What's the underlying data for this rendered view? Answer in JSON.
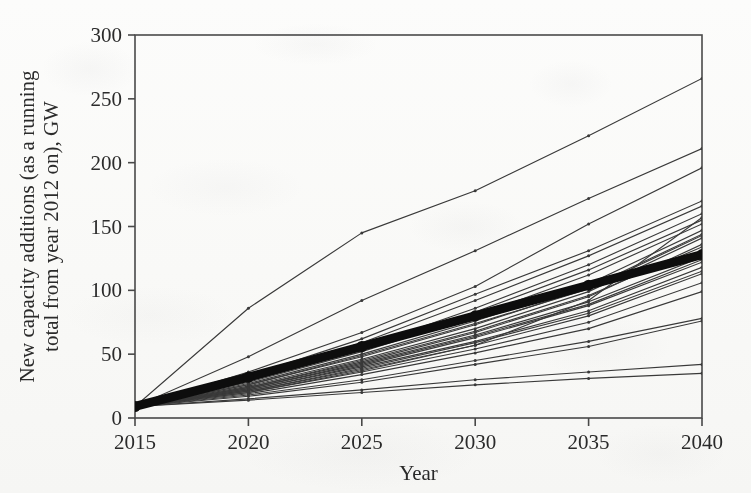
{
  "chart_data": {
    "type": "line",
    "title": "",
    "subtitle": "",
    "xlabel": "Year",
    "ylabel": "New capacity additions (as a running total from year 2012 on), GW",
    "ylabel_line1": "New capacity additions (as a running",
    "ylabel_line2": "total from year 2012 on), GW",
    "x": [
      2015,
      2020,
      2025,
      2030,
      2035,
      2040
    ],
    "xtick_labels": [
      "2015",
      "2020",
      "2025",
      "2030",
      "2035",
      "2040"
    ],
    "ytick_labels": [
      "0",
      "50",
      "100",
      "150",
      "200",
      "250",
      "300"
    ],
    "yticks": [
      0,
      50,
      100,
      150,
      200,
      250,
      300
    ],
    "xlim": [
      2015,
      2040
    ],
    "ylim": [
      0,
      300
    ],
    "grid": false,
    "legend": "none",
    "markers": "small dots at each 5-year data point",
    "colors": {
      "lines": "#3a3a3a",
      "highlight": "#0d0d0d",
      "axis": "#4a4a4a",
      "text": "#2b2b2b"
    },
    "annotations": [
      "All scenario trajectories converge to a common 2015 value of about 9 GW.",
      "One thick bold black line denotes the central/reference trajectory, ending near 128 GW in 2040."
    ],
    "series": [
      {
        "name": "scenario-01",
        "style": "thin",
        "values": [
          9,
          86,
          145,
          178,
          221,
          266
        ]
      },
      {
        "name": "scenario-02",
        "style": "thin",
        "values": [
          9,
          48,
          92,
          131,
          172,
          211
        ]
      },
      {
        "name": "scenario-03",
        "style": "thin",
        "values": [
          9,
          36,
          67,
          103,
          152,
          196
        ]
      },
      {
        "name": "scenario-04",
        "style": "thin",
        "values": [
          9,
          33,
          62,
          97,
          131,
          170
        ]
      },
      {
        "name": "scenario-05",
        "style": "thin",
        "values": [
          9,
          31,
          59,
          92,
          127,
          166
        ]
      },
      {
        "name": "scenario-06",
        "style": "thin",
        "values": [
          9,
          30,
          55,
          86,
          120,
          160
        ]
      },
      {
        "name": "scenario-07",
        "style": "thin",
        "values": [
          9,
          28,
          52,
          80,
          112,
          152
        ]
      },
      {
        "name": "scenario-08",
        "style": "thin",
        "values": [
          9,
          27,
          50,
          76,
          105,
          147
        ]
      },
      {
        "name": "scenario-09",
        "style": "thin",
        "values": [
          9,
          26,
          48,
          73,
          102,
          144
        ]
      },
      {
        "name": "scenario-10",
        "style": "thin",
        "values": [
          9,
          25,
          46,
          70,
          99,
          141
        ]
      },
      {
        "name": "scenario-11",
        "style": "thin",
        "values": [
          9,
          24,
          44,
          67,
          95,
          136
        ]
      },
      {
        "name": "reference-central",
        "style": "bold",
        "values": [
          9,
          32,
          56,
          80,
          104,
          128
        ]
      },
      {
        "name": "scenario-12",
        "style": "thin",
        "values": [
          9,
          23,
          43,
          65,
          91,
          126
        ]
      },
      {
        "name": "scenario-13",
        "style": "thin",
        "values": [
          9,
          22,
          41,
          63,
          88,
          122
        ]
      },
      {
        "name": "scenario-14",
        "style": "thin",
        "values": [
          9,
          22,
          40,
          60,
          84,
          118
        ]
      },
      {
        "name": "scenario-15",
        "style": "thin",
        "values": [
          9,
          21,
          38,
          57,
          80,
          113
        ]
      },
      {
        "name": "scenario-16",
        "style": "thin",
        "values": [
          9,
          20,
          36,
          54,
          75,
          106
        ]
      },
      {
        "name": "scenario-17",
        "style": "thin",
        "values": [
          9,
          19,
          34,
          51,
          70,
          99
        ]
      },
      {
        "name": "scenario-18",
        "style": "thin",
        "values": [
          9,
          24,
          45,
          68,
          96,
          134
        ]
      },
      {
        "name": "scenario-19",
        "style": "thin",
        "values": [
          9,
          20,
          37,
          57,
          92,
          157
        ]
      },
      {
        "name": "scenario-20",
        "style": "thin",
        "values": [
          9,
          18,
          30,
          45,
          60,
          78
        ]
      },
      {
        "name": "scenario-21",
        "style": "thin",
        "values": [
          9,
          17,
          28,
          42,
          56,
          76
        ]
      },
      {
        "name": "scenario-22",
        "style": "thin",
        "values": [
          9,
          15,
          22,
          30,
          36,
          42
        ]
      },
      {
        "name": "scenario-23",
        "style": "thin",
        "values": [
          9,
          14,
          20,
          26,
          31,
          35
        ]
      },
      {
        "name": "scenario-24",
        "style": "thin",
        "values": [
          9,
          26,
          49,
          74,
          101,
          143
        ]
      },
      {
        "name": "scenario-25",
        "style": "thin",
        "values": [
          9,
          29,
          53,
          83,
          116,
          155
        ]
      },
      {
        "name": "scenario-26",
        "style": "thin",
        "values": [
          9,
          21,
          39,
          59,
          82,
          115
        ]
      },
      {
        "name": "scenario-27",
        "style": "thin",
        "values": [
          9,
          23,
          42,
          64,
          89,
          124
        ]
      }
    ]
  }
}
